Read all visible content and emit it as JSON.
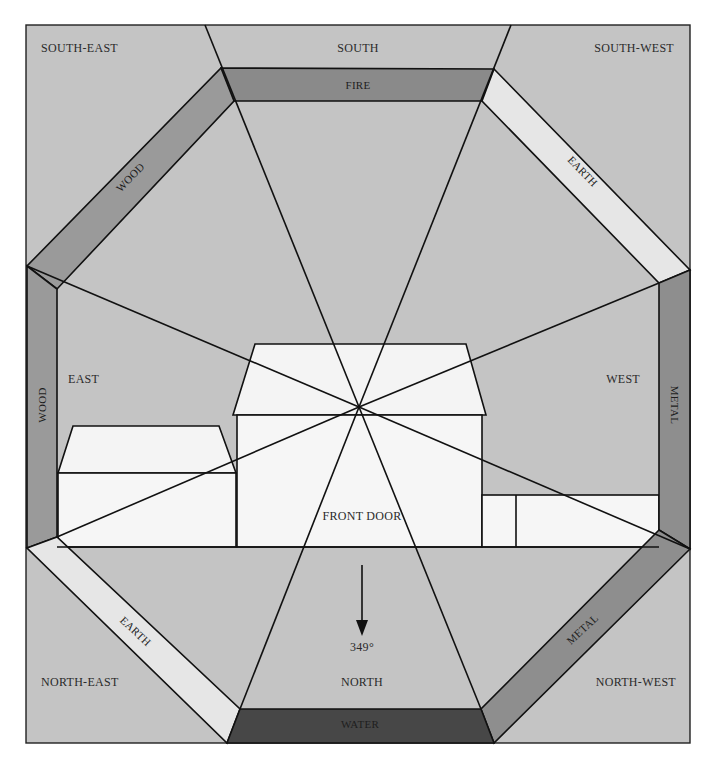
{
  "diagram": {
    "colors": {
      "background": "#c4c4c4",
      "paper": "#ffffff",
      "house": "#f6f6f6",
      "fire": "#8a8a8a",
      "wood": "#9a9a9a",
      "earth": "#e6e6e6",
      "metal": "#8e8e8e",
      "water": "#474747",
      "line": "#111111"
    },
    "directions": {
      "south_east": "SOUTH-EAST",
      "south": "SOUTH",
      "south_west": "SOUTH-WEST",
      "east": "EAST",
      "west": "WEST",
      "north_east": "NORTH-EAST",
      "north": "NORTH",
      "north_west": "NORTH-WEST"
    },
    "elements": {
      "south": "FIRE",
      "south_east": "WOOD",
      "east": "WOOD",
      "south_west": "EARTH",
      "north_east": "EARTH",
      "west": "METAL",
      "north_west": "METAL",
      "north": "WATER"
    },
    "front_door_label": "FRONT DOOR",
    "compass": {
      "bearing": "349°",
      "arrow_icon": "down-arrow-icon"
    }
  }
}
